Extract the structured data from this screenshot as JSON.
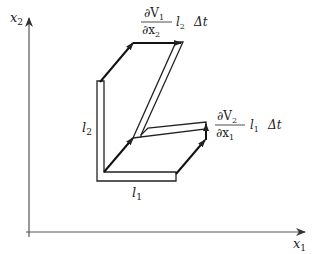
{
  "figure": {
    "axes": {
      "x_label": "x",
      "x_sub": "1",
      "y_label": "x",
      "y_sub": "2"
    },
    "labels": {
      "l1": {
        "text": "l",
        "sub": "1"
      },
      "l2": {
        "text": "l",
        "sub": "2"
      }
    },
    "top_annotation": {
      "numerator": "∂V",
      "numerator_sub": "1",
      "denominator": "∂x",
      "denominator_sub": "2",
      "length": "l",
      "length_sub": "2",
      "dt": "Δt"
    },
    "right_annotation": {
      "numerator": "∂V",
      "numerator_sub": "2",
      "denominator": "∂x",
      "denominator_sub": "1",
      "length": "l",
      "length_sub": "1",
      "dt": "Δt"
    },
    "colors": {
      "line": "#222222",
      "axis": "#444444",
      "background": "#ffffff"
    }
  }
}
